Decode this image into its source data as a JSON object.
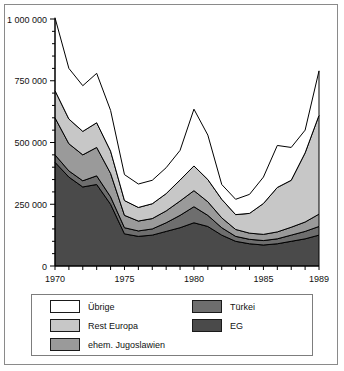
{
  "figure": {
    "background_color": "#ffffff",
    "border_color": "#8a8a8a"
  },
  "chart_data": {
    "type": "area",
    "stacked": true,
    "title": "",
    "subtitle": "",
    "xlabel": "",
    "ylabel": "",
    "grid": false,
    "legend_position": "bottom",
    "xlim": [
      1970,
      1989
    ],
    "ylim": [
      0,
      1000000
    ],
    "x": [
      1970,
      1971,
      1972,
      1973,
      1974,
      1975,
      1976,
      1977,
      1978,
      1979,
      1980,
      1981,
      1982,
      1983,
      1984,
      1985,
      1986,
      1987,
      1988,
      1989
    ],
    "xtick_labels": [
      "1970",
      "1975",
      "1980",
      "1985",
      "1989"
    ],
    "xtick_values": [
      1970,
      1975,
      1980,
      1985,
      1989
    ],
    "ytick_labels": [
      "0",
      "250 000",
      "500 000",
      "750 000",
      "1 000 000"
    ],
    "ytick_values": [
      0,
      250000,
      500000,
      750000,
      1000000
    ],
    "ytick_minor_step": 50000,
    "series": [
      {
        "name": "EG",
        "color": "#4a4a4a",
        "values": [
          420000,
          360000,
          320000,
          330000,
          250000,
          130000,
          120000,
          125000,
          140000,
          155000,
          175000,
          160000,
          125000,
          100000,
          90000,
          85000,
          90000,
          100000,
          110000,
          125000
        ]
      },
      {
        "name": "Türkei",
        "color": "#6e6e6e",
        "values": [
          30000,
          25000,
          25000,
          35000,
          30000,
          25000,
          22000,
          25000,
          35000,
          50000,
          65000,
          45000,
          30000,
          20000,
          18000,
          18000,
          20000,
          25000,
          30000,
          35000
        ]
      },
      {
        "name": "ehem. Jugoslawien",
        "color": "#9a9a9a",
        "values": [
          150000,
          110000,
          105000,
          115000,
          95000,
          50000,
          40000,
          42000,
          48000,
          58000,
          65000,
          55000,
          40000,
          28000,
          25000,
          25000,
          28000,
          32000,
          38000,
          50000
        ]
      },
      {
        "name": "Rest Europa",
        "color": "#c7c7c7",
        "values": [
          110000,
          100000,
          95000,
          100000,
          90000,
          60000,
          55000,
          60000,
          70000,
          85000,
          100000,
          90000,
          75000,
          60000,
          80000,
          125000,
          180000,
          190000,
          280000,
          400000
        ]
      },
      {
        "name": "Übrige",
        "color": "#ffffff",
        "values": [
          295000,
          205000,
          185000,
          200000,
          165000,
          105000,
          95000,
          95000,
          105000,
          120000,
          230000,
          180000,
          60000,
          62000,
          77000,
          107000,
          170000,
          133000,
          92000,
          180000
        ]
      }
    ],
    "totals": [
      1005000,
      800000,
      730000,
      780000,
      630000,
      370000,
      332000,
      347000,
      398000,
      468000,
      635000,
      530000,
      330000,
      270000,
      290000,
      360000,
      488000,
      480000,
      550000,
      790000
    ]
  },
  "legend": {
    "items": [
      {
        "label": "Übrige",
        "color": "#ffffff"
      },
      {
        "label": "Rest Europa",
        "color": "#c7c7c7"
      },
      {
        "label": "ehem. Jugoslawien",
        "color": "#9a9a9a"
      },
      {
        "label": "Türkei",
        "color": "#6e6e6e"
      },
      {
        "label": "EG",
        "color": "#4a4a4a"
      }
    ]
  }
}
